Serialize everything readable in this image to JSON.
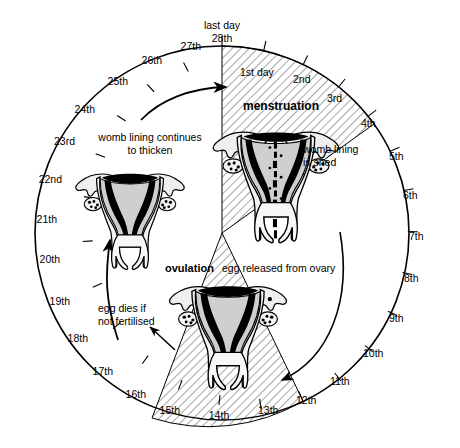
{
  "diagram": {
    "geometry": {
      "center_x": 222,
      "center_y": 233,
      "ring_radius": 187,
      "days_total": 28
    },
    "colors": {
      "stroke": "#000000",
      "background": "#ffffff",
      "hatch": "#000000",
      "lining_mid": "#cccccc",
      "lining_light": "#f2f2f2",
      "cavity_dark": "#000000"
    },
    "day_labels": [
      {
        "day": 1,
        "text": "1st day"
      },
      {
        "day": 2,
        "text": "2nd"
      },
      {
        "day": 3,
        "text": "3rd"
      },
      {
        "day": 4,
        "text": "4th"
      },
      {
        "day": 5,
        "text": "5th"
      },
      {
        "day": 6,
        "text": "6th"
      },
      {
        "day": 7,
        "text": "7th"
      },
      {
        "day": 8,
        "text": "8th"
      },
      {
        "day": 9,
        "text": "9th"
      },
      {
        "day": 10,
        "text": "10th"
      },
      {
        "day": 11,
        "text": "11th"
      },
      {
        "day": 12,
        "text": "12th"
      },
      {
        "day": 13,
        "text": "13th"
      },
      {
        "day": 14,
        "text": "14th"
      },
      {
        "day": 15,
        "text": "15th"
      },
      {
        "day": 16,
        "text": "16th"
      },
      {
        "day": 17,
        "text": "17th"
      },
      {
        "day": 18,
        "text": "18th"
      },
      {
        "day": 19,
        "text": "19th"
      },
      {
        "day": 20,
        "text": "20th"
      },
      {
        "day": 21,
        "text": "21th"
      },
      {
        "day": 22,
        "text": "22nd"
      },
      {
        "day": 23,
        "text": "23rd"
      },
      {
        "day": 24,
        "text": "24th"
      },
      {
        "day": 25,
        "text": "25th"
      },
      {
        "day": 26,
        "text": "26th"
      },
      {
        "day": 27,
        "text": "27th"
      },
      {
        "day": 28,
        "text": "28th"
      }
    ],
    "annotations": {
      "last_day": "last day",
      "menstruation": "menstruation",
      "womb_lining_is_shed": [
        "womb lining",
        "is shed"
      ],
      "womb_lining_continues": [
        "womb lining continues",
        "to thicken"
      ],
      "ovulation_bold": "ovulation",
      "ovulation_rest": "egg released from ovary",
      "egg_dies": [
        "egg dies if",
        "not fertilised"
      ]
    },
    "phases": [
      {
        "name": "menstruation",
        "start_day": 1,
        "end_day": 6,
        "hatched": true
      },
      {
        "name": "ovulation",
        "start_day": 12,
        "end_day": 15.5,
        "hatched": true
      }
    ],
    "uteri": [
      {
        "name": "uterus-menstruation",
        "position": "top",
        "state": "lining-shedding"
      },
      {
        "name": "uterus-ovulation",
        "position": "bottom",
        "state": "egg-released"
      },
      {
        "name": "uterus-thickening",
        "position": "left",
        "state": "lining-thickening"
      }
    ]
  }
}
